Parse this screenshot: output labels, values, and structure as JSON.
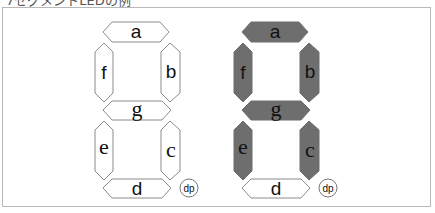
{
  "caption": "7セグメントLEDの例",
  "displays": [
    {
      "name": "blank-display",
      "offset_x": 0,
      "segments": {
        "a": {
          "label": "a",
          "on": false
        },
        "b": {
          "label": "b",
          "on": false
        },
        "c": {
          "label": "c",
          "on": false
        },
        "d": {
          "label": "d",
          "on": false
        },
        "e": {
          "label": "e",
          "on": false
        },
        "f": {
          "label": "f",
          "on": false
        },
        "g": {
          "label": "g",
          "on": false
        }
      },
      "dp": {
        "label": "dp",
        "on": false
      }
    },
    {
      "name": "lit-display-A",
      "offset_x": 139,
      "segments": {
        "a": {
          "label": "a",
          "on": true
        },
        "b": {
          "label": "b",
          "on": true
        },
        "c": {
          "label": "c",
          "on": true
        },
        "d": {
          "label": "d",
          "on": false
        },
        "e": {
          "label": "e",
          "on": true
        },
        "f": {
          "label": "f",
          "on": true
        },
        "g": {
          "label": "g",
          "on": true
        }
      },
      "dp": {
        "label": "dp",
        "on": false
      }
    }
  ],
  "colors": {
    "segment_on": "#6e6e6e",
    "segment_off": "#ffffff",
    "segment_outline": "#8a8a8a",
    "frame_border": "#b8b8b8"
  }
}
